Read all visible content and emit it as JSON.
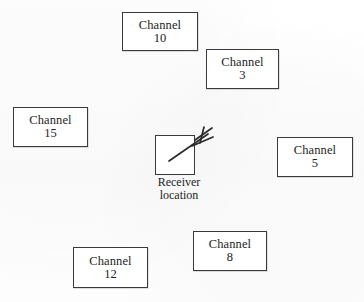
{
  "diagram": {
    "type": "spatial-layout-diagram",
    "canvas": {
      "width": 364,
      "height": 302
    },
    "colors": {
      "background": "#fdfdfd",
      "stroke": "#3a3a3a",
      "text": "#1d1d1d",
      "box_fill": "#ffffff"
    },
    "channel_boxes": [
      {
        "id": "channel-10",
        "label": "Channel",
        "number": "10",
        "x": 122,
        "y": 12,
        "width": 76,
        "height": 39
      },
      {
        "id": "channel-3",
        "label": "Channel",
        "number": "3",
        "x": 206,
        "y": 49,
        "width": 73,
        "height": 40
      },
      {
        "id": "channel-15",
        "label": "Channel",
        "number": "15",
        "x": 13,
        "y": 107,
        "width": 75,
        "height": 40
      },
      {
        "id": "channel-5",
        "label": "Channel",
        "number": "5",
        "x": 277,
        "y": 137,
        "width": 76,
        "height": 40
      },
      {
        "id": "channel-8",
        "label": "Channel",
        "number": "8",
        "x": 193,
        "y": 231,
        "width": 74,
        "height": 40
      },
      {
        "id": "channel-12",
        "label": "Channel",
        "number": "12",
        "x": 73,
        "y": 247,
        "width": 75,
        "height": 41
      }
    ],
    "receiver": {
      "id": "receiver",
      "caption_line_1": "Receiver",
      "caption_line_2": "location",
      "box": {
        "x": 155,
        "y": 135,
        "width": 40,
        "height": 40
      },
      "antenna_icon": "antenna-icon"
    }
  }
}
